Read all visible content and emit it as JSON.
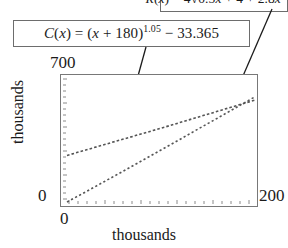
{
  "figure": {
    "callouts": [
      {
        "name": "revenue-formula",
        "label": "R(x) = 4√0.5x + 4 + 2.8x − 8",
        "lhs": "R",
        "arg": "x",
        "clipped_at_top": true
      },
      {
        "name": "cost-formula",
        "label": "C(x) = (x + 180)1.05 − 33.365",
        "lhs": "C",
        "arg": "x",
        "base": "(x + 180)",
        "exponent": "1.05",
        "constant": "− 33.365"
      }
    ]
  },
  "axes": {
    "y_max_label": "700",
    "y_zero_label": "0",
    "x_zero_label": "0",
    "x_max_label": "200",
    "x_title": "thousands",
    "y_title": "thousands"
  },
  "chart_data": {
    "type": "line",
    "title": "",
    "xlabel": "thousands",
    "ylabel": "thousands",
    "xlim": [
      0,
      200
    ],
    "ylim": [
      0,
      700
    ],
    "grid": false,
    "legend": "none",
    "line_style": "dotted",
    "annotations": [
      {
        "text": "R(x) = 4√0.5x + 4 + 2.8x − 8",
        "points_to_series": "R(x)"
      },
      {
        "text": "C(x) = (x + 180)^1.05 − 33.365",
        "points_to_series": "C(x)"
      }
    ],
    "x": [
      0,
      20,
      40,
      60,
      80,
      100,
      120,
      140,
      160,
      180,
      200
    ],
    "series": [
      {
        "name": "R(x)",
        "values": [
          0,
          58,
          117,
          176,
          236,
          296,
          356,
          417,
          477,
          538,
          599
        ]
      },
      {
        "name": "C(x)",
        "values": [
          265,
          296,
          327,
          358,
          389,
          420,
          452,
          484,
          516,
          548,
          580
        ]
      }
    ],
    "intersection_approx": {
      "x": 150,
      "y": 500
    }
  },
  "colors": {
    "frame": "#787878",
    "box_border": "#6d6d6d",
    "curve": "#555555",
    "leader": "#1b1b1b",
    "text": "#1b1b1b",
    "background": "#ffffff"
  },
  "icons": {
    "radical": "√",
    "minus": "−"
  }
}
